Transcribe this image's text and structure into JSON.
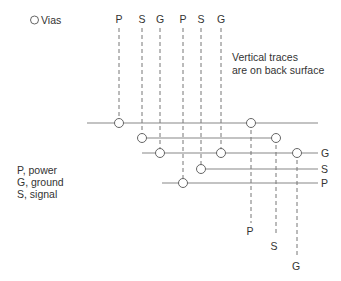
{
  "legend": {
    "vias_label": "Vias",
    "vias_symbol": "circle-icon"
  },
  "note": {
    "line1": "Vertical traces",
    "line2": "are on back surface"
  },
  "key": {
    "line1": "P, power",
    "line2": "G, ground",
    "line3": "S, signal"
  },
  "top_labels": [
    "P",
    "S",
    "G",
    "P",
    "S",
    "G"
  ],
  "right_labels": [
    "G",
    "S",
    "P"
  ],
  "bottom_labels": [
    "P",
    "S",
    "G"
  ],
  "colors": {
    "trace": "#888888",
    "text": "#333333",
    "via_fill": "#ffffff"
  }
}
